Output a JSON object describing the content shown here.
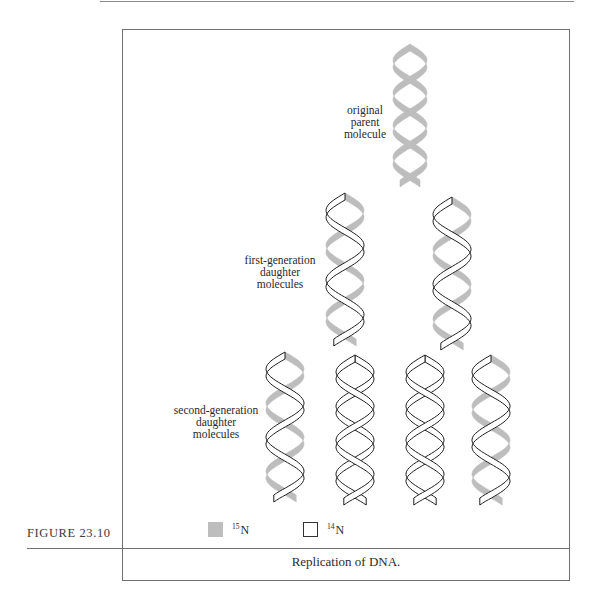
{
  "figure": {
    "number_label": "FIGURE 23.10",
    "caption": "Replication of DNA."
  },
  "colors": {
    "heavy_strand": "#bdbdbd",
    "light_strand_fill": "#ffffff",
    "light_strand_stroke": "#1e1e1e",
    "frame": "#6f6f6f"
  },
  "labels": {
    "parent": [
      "original",
      "parent",
      "molecule"
    ],
    "first_generation": [
      "first-generation",
      "daughter",
      "molecules"
    ],
    "second_generation": [
      "second-generation",
      "daughter",
      "molecules"
    ]
  },
  "legend": [
    {
      "isotope_mass": "15",
      "element": "N",
      "swatch": "gray filled",
      "meaning": "heavy strand"
    },
    {
      "isotope_mass": "14",
      "element": "N",
      "swatch": "white outlined",
      "meaning": "light strand"
    }
  ],
  "molecules": [
    {
      "generation": "parent",
      "strands": [
        "15N",
        "15N"
      ]
    },
    {
      "generation": "first",
      "strands": [
        "15N",
        "14N"
      ]
    },
    {
      "generation": "first",
      "strands": [
        "15N",
        "14N"
      ]
    },
    {
      "generation": "second",
      "strands": [
        "15N",
        "14N"
      ]
    },
    {
      "generation": "second",
      "strands": [
        "14N",
        "14N"
      ]
    },
    {
      "generation": "second",
      "strands": [
        "14N",
        "14N"
      ]
    },
    {
      "generation": "second",
      "strands": [
        "15N",
        "14N"
      ]
    }
  ]
}
